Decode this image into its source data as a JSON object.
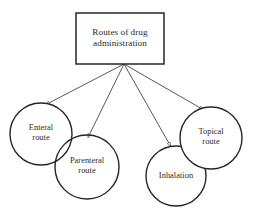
{
  "diagram": {
    "title": "Routes of drug administration",
    "root": {
      "label": "Routes of drug\nadministration",
      "shape": "rectangle",
      "x": 76,
      "y": 13,
      "width": 88,
      "height": 51,
      "stroke": "#262626",
      "fill": "#ffffff"
    },
    "nodes": [
      {
        "id": "enteral",
        "label": "Enteral\nroute",
        "shape": "circle",
        "cx": 41,
        "cy": 134,
        "r": 31,
        "stroke": "#262626",
        "fill": "#ffffff"
      },
      {
        "id": "parenteral",
        "label": "Parenteral\nroute",
        "shape": "circle",
        "cx": 87,
        "cy": 167,
        "r": 32,
        "stroke": "#262626",
        "fill": "#ffffff"
      },
      {
        "id": "inhalation",
        "label": "Inhalation",
        "shape": "circle",
        "cx": 176,
        "cy": 176,
        "r": 30,
        "stroke": "#262626",
        "fill": "#ffffff"
      },
      {
        "id": "topical",
        "label": "Topical\nroute",
        "shape": "circle",
        "cx": 211,
        "cy": 138,
        "r": 31,
        "stroke": "#262626",
        "fill": "#ffffff"
      }
    ],
    "connectors": [
      {
        "id": "root-to-enteral",
        "from": "root",
        "to": "enteral",
        "x1": 124,
        "y1": 64,
        "x2": 46,
        "y2": 103,
        "arrowhead": "open-triangle"
      },
      {
        "id": "root-to-parenteral",
        "from": "root",
        "to": "parenteral",
        "x1": 124,
        "y1": 64,
        "x2": 87,
        "y2": 136,
        "arrowhead": "open-triangle"
      },
      {
        "id": "root-to-inhalation",
        "from": "root",
        "to": "inhalation",
        "x1": 124,
        "y1": 64,
        "x2": 172,
        "y2": 148,
        "arrowhead": "open-triangle"
      },
      {
        "id": "root-to-topical",
        "from": "root",
        "to": "topical",
        "x1": 124,
        "y1": 64,
        "x2": 204,
        "y2": 108,
        "arrowhead": "open-triangle"
      }
    ],
    "colors": {
      "stroke": "#262626",
      "line": "#3a3a3a",
      "text": "#2a2a2a",
      "background": "#ffffff"
    }
  }
}
